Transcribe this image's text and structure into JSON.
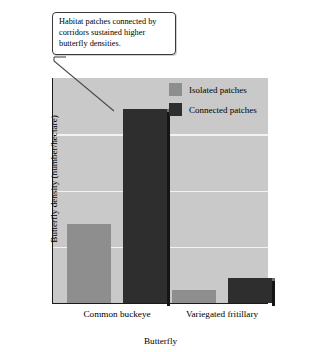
{
  "callout": {
    "text": "Habitat patches connected by corridors sustained higher butterfly densities."
  },
  "legend": {
    "items": [
      {
        "label": "Isolated patches",
        "color": "#8e8e8e",
        "key": "isolated"
      },
      {
        "label": "Connected patches",
        "color": "#2e2e2e",
        "key": "connected"
      }
    ]
  },
  "axes": {
    "y_title": "Butterfly density (number/hectare)",
    "x_title": "Butterfly",
    "y_ticks": [
      "0",
      "1",
      "2",
      "3",
      "4"
    ]
  },
  "colors": {
    "plot_background": "#c9c9c9",
    "gridline": "#f2f2f2",
    "axis": "#1a1a1a",
    "isolated": "#8e8e8e",
    "connected": "#2e2e2e",
    "callout_background": "#ffffff",
    "callout_border": "#3a3a3a"
  },
  "chart_data": {
    "type": "bar",
    "title": "Habitat patches connected by corridors sustained higher butterfly densities.",
    "xlabel": "Butterfly",
    "ylabel": "Butterfly density (number/hectare)",
    "categories": [
      "Common buckeye",
      "Variegated fritillary"
    ],
    "series": [
      {
        "name": "Isolated patches",
        "color": "#8e8e8e",
        "values": [
          1.4,
          0.23
        ]
      },
      {
        "name": "Connected patches",
        "color": "#2e2e2e",
        "values": [
          3.45,
          0.45
        ]
      }
    ],
    "ylim": [
      0,
      4
    ],
    "yticks": [
      0,
      1,
      2,
      3,
      4
    ],
    "grid": true,
    "gridlines_at": [
      1,
      2,
      3
    ],
    "legend_position": "inside top-right"
  }
}
